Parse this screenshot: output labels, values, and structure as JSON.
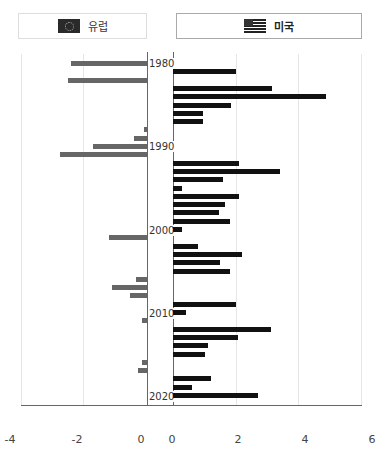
{
  "legend": {
    "eu": {
      "label": "유럽",
      "icon": "eu-flag-icon"
    },
    "us": {
      "label": "미국",
      "icon": "us-flag-icon"
    }
  },
  "colors": {
    "eu": "#666666",
    "us": "#111111"
  },
  "axis": {
    "left_ticks": [
      "-4",
      "-2",
      "0"
    ],
    "right_ticks": [
      "0",
      "2",
      "4",
      "6"
    ]
  },
  "year_labels": [
    "1980",
    "1990",
    "2000",
    "2010",
    "2020"
  ],
  "chart_data": [
    {
      "type": "bar",
      "orientation": "horizontal",
      "title": "유럽",
      "xlim": [
        -4,
        0
      ],
      "categories": [
        1980,
        1982,
        1988,
        1989,
        1990,
        1991,
        2001,
        2006,
        2007,
        2008,
        2011,
        2016,
        2017
      ],
      "values": [
        -2.4,
        -2.5,
        -0.1,
        -0.4,
        -1.7,
        -2.75,
        -1.2,
        -0.35,
        -1.1,
        -0.55,
        -0.15,
        -0.15,
        -0.28
      ]
    },
    {
      "type": "bar",
      "orientation": "horizontal",
      "title": "미국",
      "xlim": [
        0,
        6
      ],
      "categories": [
        1981,
        1983,
        1984,
        1985,
        1986,
        1987,
        1992,
        1993,
        1994,
        1995,
        1996,
        1997,
        1998,
        1999,
        2000,
        2002,
        2003,
        2004,
        2005,
        2009,
        2010,
        2012,
        2013,
        2014,
        2015,
        2018,
        2019,
        2020
      ],
      "values": [
        2.0,
        3.15,
        4.85,
        1.85,
        0.95,
        0.95,
        2.1,
        3.4,
        1.6,
        0.3,
        2.1,
        1.65,
        1.45,
        1.8,
        0.3,
        0.8,
        2.2,
        1.5,
        1.8,
        2.0,
        0.4,
        3.1,
        2.05,
        1.1,
        1.0,
        1.2,
        0.6,
        2.7
      ]
    }
  ]
}
